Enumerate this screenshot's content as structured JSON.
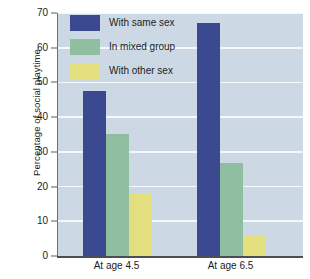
{
  "chart_data": {
    "type": "bar",
    "title": "",
    "subtitle": "",
    "xlabel": "",
    "ylabel": "Percentage of social playtime",
    "categories": [
      "At age 4.5",
      "At age 6.5"
    ],
    "series": [
      {
        "name": "With same sex",
        "color": "#3b4a90",
        "values": [
          47.5,
          67.0
        ]
      },
      {
        "name": "In mixed group",
        "color": "#8fbfa0",
        "values": [
          35.2,
          26.8
        ]
      },
      {
        "name": "With other sex",
        "color": "#e3df7e",
        "values": [
          18.2,
          6.1
        ]
      }
    ],
    "ylim": [
      0,
      70
    ],
    "yticks": [
      0,
      10,
      20,
      30,
      40,
      50,
      60,
      70
    ],
    "ytick_labels": [
      "0",
      "10",
      "20",
      "30",
      "40",
      "50",
      "60",
      "70"
    ],
    "grid": true,
    "grid_color": "#f4f8fb",
    "legend_position": "top-left-inside",
    "plot_background": "#ccd9e4",
    "figure_background": "#ffffff",
    "axis_color": "#55595c",
    "text_color": "#1c1c1c"
  }
}
